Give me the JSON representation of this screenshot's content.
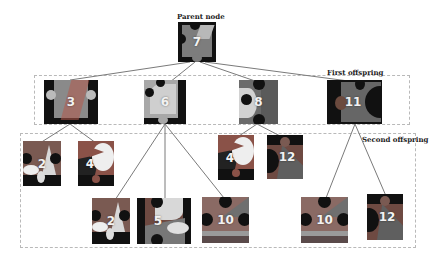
{
  "labels": {
    "parent": "Parent node",
    "first": "First offspring",
    "second": "Second offspring"
  },
  "colors": {
    "line": "#7a7a7a",
    "dash": "#b9b9b9",
    "tile_dark": "#111111",
    "tile_mid": "#6e6e6e",
    "tile_light": "#c8c8c8"
  },
  "tree": {
    "parent": {
      "id": "7"
    },
    "first_offspring": [
      {
        "id": "3",
        "children": [
          "2",
          "4"
        ]
      },
      {
        "id": "6",
        "children": [
          "2",
          "5",
          "10"
        ]
      },
      {
        "id": "8",
        "children": [
          "4",
          "12"
        ]
      },
      {
        "id": "11",
        "children": [
          "10",
          "12"
        ]
      }
    ]
  },
  "tiles": {
    "parent_7": "7",
    "f_3": "3",
    "f_6": "6",
    "f_8": "8",
    "f_11": "11",
    "s_3_2": "2",
    "s_3_4": "4",
    "s_6_2": "2",
    "s_6_5": "5",
    "s_6_10": "10",
    "s_8_4": "4",
    "s_8_12": "12",
    "s_11_10": "10",
    "s_11_12": "12"
  }
}
